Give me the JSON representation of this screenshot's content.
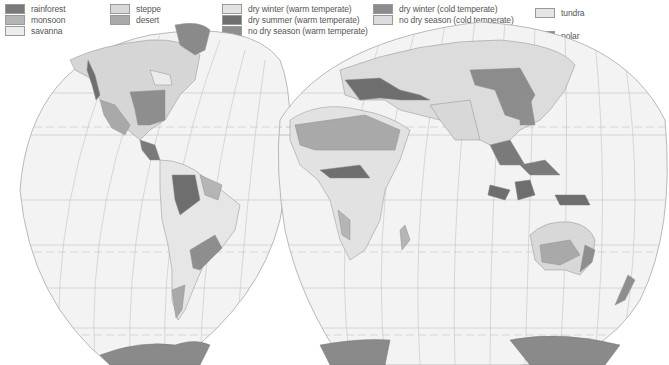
{
  "legend": {
    "items": [
      {
        "id": "rainforest",
        "label": "rainforest",
        "color": "#7a7a7a",
        "x": 5,
        "y": 4
      },
      {
        "id": "monsoon",
        "label": "monsoon",
        "color": "#b5b5b5",
        "x": 5,
        "y": 15
      },
      {
        "id": "savanna",
        "label": "savanna",
        "color": "#ececec",
        "x": 5,
        "y": 26
      },
      {
        "id": "steppe",
        "label": "steppe",
        "color": "#d8d8d8",
        "x": 110,
        "y": 4
      },
      {
        "id": "desert",
        "label": "desert",
        "color": "#a9a9a9",
        "x": 110,
        "y": 15
      },
      {
        "id": "dry-winter-warm",
        "label": "dry winter (warm temperate)",
        "color": "#e2e2e2",
        "x": 222,
        "y": 4
      },
      {
        "id": "dry-summer-warm",
        "label": "dry summer (warm temperate)",
        "color": "#6e6e6e",
        "x": 222,
        "y": 15
      },
      {
        "id": "no-dry-season-warm",
        "label": "no dry season (warm temperate)",
        "color": "#8e8e8e",
        "x": 222,
        "y": 26
      },
      {
        "id": "dry-winter-cold",
        "label": "dry winter (cold temperate)",
        "color": "#8c8c8c",
        "x": 373,
        "y": 4
      },
      {
        "id": "no-dry-season-cold",
        "label": "no dry season (cold temperate)",
        "color": "#dcdcdc",
        "x": 373,
        "y": 15
      },
      {
        "id": "tundra",
        "label": "tundra",
        "color": "#e4e4e4",
        "x": 535,
        "y": 8
      },
      {
        "id": "polar",
        "label": "polar",
        "color": "#8a8a8a",
        "x": 535,
        "y": 31
      }
    ]
  },
  "map": {
    "ocean_color": "#f3f3f3",
    "graticule_color": "#bdbdbd",
    "tropic_line_color": "#c4c4c4",
    "coast_color": "#8f8f8f"
  }
}
